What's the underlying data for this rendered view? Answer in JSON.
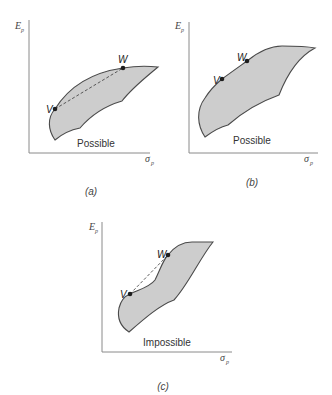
{
  "colors": {
    "fill": "#cdcdcd",
    "stroke": "#4a4a4a",
    "axis": "#8a8a8a"
  },
  "panels": [
    {
      "id": "a",
      "caption": "(a)",
      "y_axis_label": "E",
      "y_axis_sub": "p",
      "x_axis_label": "σ",
      "x_axis_sub": "p",
      "region_label": "Possible",
      "point_v": "V",
      "point_w": "W",
      "has_dashed_chord": true
    },
    {
      "id": "b",
      "caption": "(b)",
      "y_axis_label": "E",
      "y_axis_sub": "p",
      "x_axis_label": "σ",
      "x_axis_sub": "p",
      "region_label": "Possible",
      "point_v": "V",
      "point_w": "W",
      "has_dashed_chord": false
    },
    {
      "id": "c",
      "caption": "(c)",
      "y_axis_label": "E",
      "y_axis_sub": "p",
      "x_axis_label": "σ",
      "x_axis_sub": "p",
      "region_label": "Impossible",
      "point_v": "V",
      "point_w": "W",
      "has_dashed_chord": true
    }
  ]
}
